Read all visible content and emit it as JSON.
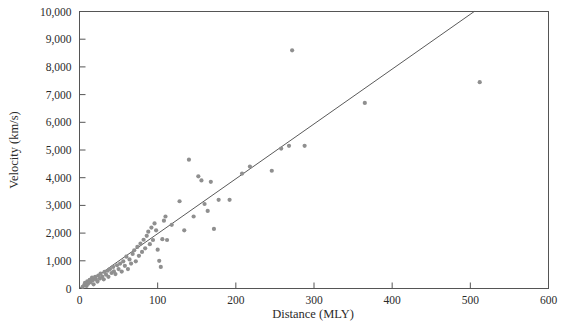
{
  "chart_data": {
    "type": "scatter",
    "title": "",
    "xlabel": "Distance (MLY)",
    "ylabel": "Velocity (km/s)",
    "xlim": [
      0,
      600
    ],
    "ylim": [
      0,
      10000
    ],
    "xticks": [
      0,
      100,
      200,
      300,
      400,
      500,
      600
    ],
    "xtick_labels": [
      "0",
      "100",
      "200",
      "300",
      "400",
      "500",
      "600"
    ],
    "yticks": [
      0,
      1000,
      2000,
      3000,
      4000,
      5000,
      6000,
      7000,
      8000,
      9000,
      10000
    ],
    "ytick_labels": [
      "0",
      "1,000",
      "2,000",
      "3,000",
      "4,000",
      "5,000",
      "6,000",
      "7,000",
      "8,000",
      "9,000",
      "10,000"
    ],
    "grid": false,
    "legend": null,
    "marker_color": "#8f8f8f",
    "marker_size": 4.2,
    "line_color": "#5a5a5a",
    "trendline": {
      "label": "",
      "slope": 19.8,
      "intercept": 0,
      "x_start": 0,
      "y_start": 0,
      "x_end": 505,
      "y_end": 10000
    },
    "series": [
      {
        "name": "Galaxies",
        "points": [
          [
            4,
            60
          ],
          [
            6,
            120
          ],
          [
            7,
            200
          ],
          [
            9,
            90
          ],
          [
            10,
            260
          ],
          [
            11,
            170
          ],
          [
            13,
            310
          ],
          [
            14,
            230
          ],
          [
            16,
            390
          ],
          [
            17,
            300
          ],
          [
            18,
            150
          ],
          [
            20,
            420
          ],
          [
            21,
            340
          ],
          [
            23,
            250
          ],
          [
            24,
            470
          ],
          [
            26,
            360
          ],
          [
            27,
            540
          ],
          [
            29,
            430
          ],
          [
            31,
            330
          ],
          [
            32,
            600
          ],
          [
            34,
            500
          ],
          [
            36,
            640
          ],
          [
            37,
            420
          ],
          [
            39,
            700
          ],
          [
            41,
            560
          ],
          [
            43,
            780
          ],
          [
            44,
            620
          ],
          [
            46,
            520
          ],
          [
            48,
            840
          ],
          [
            50,
            700
          ],
          [
            52,
            900
          ],
          [
            54,
            610
          ],
          [
            56,
            980
          ],
          [
            58,
            820
          ],
          [
            60,
            1150
          ],
          [
            62,
            700
          ],
          [
            64,
            1050
          ],
          [
            66,
            900
          ],
          [
            68,
            1250
          ],
          [
            70,
            1380
          ],
          [
            72,
            980
          ],
          [
            74,
            1500
          ],
          [
            76,
            1180
          ],
          [
            78,
            1620
          ],
          [
            80,
            1320
          ],
          [
            82,
            1760
          ],
          [
            84,
            1450
          ],
          [
            86,
            1900
          ],
          [
            88,
            2050
          ],
          [
            90,
            1600
          ],
          [
            92,
            2200
          ],
          [
            94,
            1750
          ],
          [
            96,
            2350
          ],
          [
            98,
            2100
          ],
          [
            100,
            1400
          ],
          [
            102,
            1000
          ],
          [
            104,
            780
          ],
          [
            106,
            1780
          ],
          [
            108,
            2450
          ],
          [
            110,
            2600
          ],
          [
            112,
            1750
          ],
          [
            118,
            2300
          ],
          [
            128,
            3150
          ],
          [
            134,
            2100
          ],
          [
            140,
            4650
          ],
          [
            146,
            2600
          ],
          [
            152,
            4050
          ],
          [
            156,
            3900
          ],
          [
            160,
            3050
          ],
          [
            164,
            2800
          ],
          [
            168,
            3850
          ],
          [
            172,
            2150
          ],
          [
            178,
            3200
          ],
          [
            192,
            3200
          ],
          [
            208,
            4150
          ],
          [
            218,
            4400
          ],
          [
            246,
            4250
          ],
          [
            258,
            5050
          ],
          [
            268,
            5150
          ],
          [
            272,
            8600
          ],
          [
            288,
            5150
          ],
          [
            365,
            6700
          ],
          [
            512,
            7450
          ]
        ]
      }
    ]
  },
  "figure": {
    "background_color": "#ffffff",
    "frame_color": "#555555"
  }
}
